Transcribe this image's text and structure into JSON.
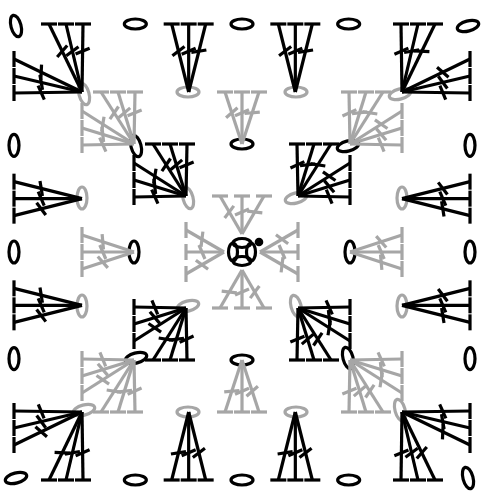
{
  "diagram": {
    "type": "crochet-chart",
    "center": [
      242,
      252
    ],
    "unit": 52,
    "colors": {
      "odd_round": "#000000",
      "even_round": "#a6a6a6",
      "background": "#ffffff"
    },
    "stitch_legend": {
      "chain": "oval (ch)",
      "double_crochet": "T with one crossbar (dc)",
      "slip_stitch": "filled dot (sl st)"
    },
    "center_ring": {
      "chains": 4,
      "color": "#000000",
      "join": "slip-stitch"
    },
    "rounds": [
      {
        "round": 1,
        "color": "#a6a6a6",
        "clusters_per_side": 1,
        "cluster": "3 dc",
        "corner_chain_space": "ch 2",
        "starting_chain": "ch 3"
      },
      {
        "round": 2,
        "color": "#000000",
        "clusters_per_side": 2,
        "cluster": "3 dc",
        "corner_chain_space": "ch 2",
        "side_chain_space": "ch 1",
        "starting_chain": "ch 3"
      },
      {
        "round": 3,
        "color": "#a6a6a6",
        "clusters_per_side": 3,
        "cluster": "3 dc",
        "corner_chain_space": "ch 2",
        "side_chain_space": "ch 1",
        "starting_chain": "ch 3"
      },
      {
        "round": 4,
        "color": "#000000",
        "clusters_per_side": 4,
        "cluster": "3 dc",
        "corner_chain_space": "ch 2",
        "side_chain_space": "ch 1",
        "starting_chain": "ch 3"
      }
    ]
  }
}
